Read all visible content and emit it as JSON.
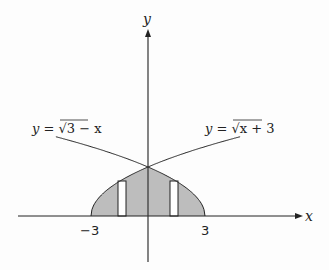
{
  "figure": {
    "axes": {
      "x_label": "x",
      "y_label": "y"
    },
    "ticks": {
      "left": "−3",
      "right": "3"
    },
    "curves": [
      {
        "name": "left-curve",
        "label_lhs": "y",
        "label_eq": " = √",
        "label_rhs": "3 − x",
        "equation": "y = √(3 − x)"
      },
      {
        "name": "right-curve",
        "label_lhs": "y",
        "label_eq": " = √",
        "label_rhs": "x + 3",
        "equation": "y = √(x + 3)"
      }
    ],
    "region": {
      "description": "Shaded region bounded by y=√(x+3), y=√(3−x) and the x-axis from x=−3 to x=3",
      "fill": "#bdbdbd"
    },
    "rectangles": [
      {
        "name": "left-strip",
        "x_center": -1.5
      },
      {
        "name": "right-strip",
        "x_center": 1.5
      }
    ],
    "colors": {
      "line": "#222222",
      "shade": "#bdbdbd",
      "background": "#fdfdfd"
    }
  }
}
